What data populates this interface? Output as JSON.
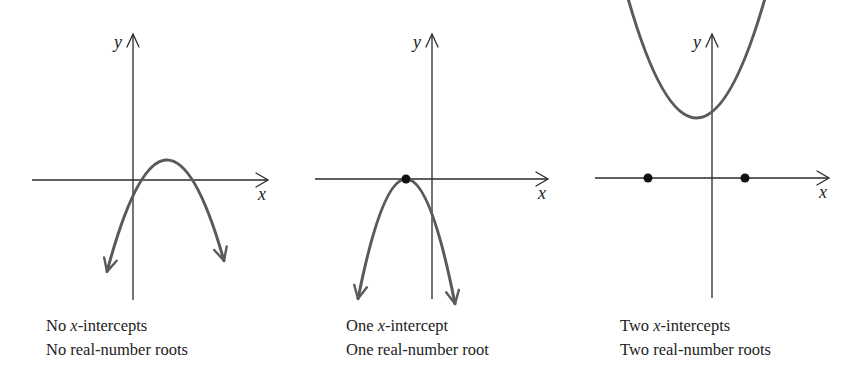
{
  "colors": {
    "background": "#ffffff",
    "axis": "#2a2a2a",
    "curve": "#5a5a5a",
    "point": "#111111",
    "text": "#222222"
  },
  "axis_labels": {
    "x": "x",
    "y": "y"
  },
  "panels": [
    {
      "id": "no-intercepts",
      "caption": {
        "line1_prefix": "No ",
        "line1_var": "x",
        "line1_suffix": "-intercepts",
        "line2": "No real-number roots"
      },
      "axes": {
        "origin_x": 133,
        "origin_y": 180,
        "x_start": 32,
        "x_end": 268,
        "y_top": 34,
        "y_bottom": 300
      },
      "parabola": {
        "vertex_x": 167,
        "vertex_y": 160,
        "a": 0.031,
        "x_left": 107,
        "x_right": 224,
        "opens": "up"
      },
      "intercepts": []
    },
    {
      "id": "one-intercept",
      "caption": {
        "line1_prefix": "One ",
        "line1_var": "x",
        "line1_suffix": "-intercept",
        "line2": "One real-number root"
      },
      "axes": {
        "origin_x": 432,
        "origin_y": 179,
        "x_start": 315,
        "x_end": 548,
        "y_top": 34,
        "y_bottom": 299
      },
      "parabola": {
        "vertex_x": 406,
        "vertex_y": 179,
        "a": 0.052,
        "x_left": 358,
        "x_right": 455,
        "opens": "up"
      },
      "intercepts": [
        {
          "x": 406,
          "y": 179
        }
      ]
    },
    {
      "id": "two-intercepts",
      "caption": {
        "line1_prefix": "Two ",
        "line1_var": "x",
        "line1_suffix": "-intercepts",
        "line2": "Two real-number roots"
      },
      "axes": {
        "origin_x": 712,
        "origin_y": 178,
        "x_start": 595,
        "x_end": 829,
        "y_top": 34,
        "y_bottom": 298
      },
      "parabola": {
        "vertex_x": 696.5,
        "vertex_y": 118,
        "a": -0.0255,
        "x_left": 611,
        "x_right": 781,
        "opens": "down"
      },
      "intercepts": [
        {
          "x": 648,
          "y": 178
        },
        {
          "x": 745,
          "y": 178
        }
      ]
    }
  ]
}
